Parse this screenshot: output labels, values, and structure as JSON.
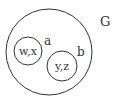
{
  "diagram": {
    "type": "venn-nested-sets",
    "outer_set": {
      "label": "G"
    },
    "subsets": [
      {
        "label": "a",
        "elements": "w,x"
      },
      {
        "label": "b",
        "elements": "y,z"
      }
    ],
    "colors": {
      "stroke": "#333333",
      "text": "#333333",
      "background": "#ffffff"
    }
  }
}
